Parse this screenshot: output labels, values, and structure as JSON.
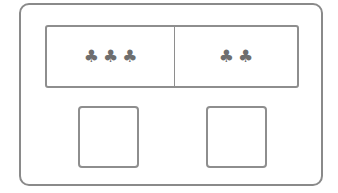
{
  "board": {
    "groups": [
      {
        "count": 3,
        "symbols": [
          "♣",
          "♣",
          "♣"
        ],
        "icon": "club-icon"
      },
      {
        "count": 2,
        "symbols": [
          "♣",
          "♣"
        ],
        "icon": "club-icon"
      }
    ],
    "answer_slots": [
      {
        "value": ""
      },
      {
        "value": ""
      }
    ]
  },
  "colors": {
    "border": "#8e8e8e",
    "symbol": "#6e6e6e"
  }
}
